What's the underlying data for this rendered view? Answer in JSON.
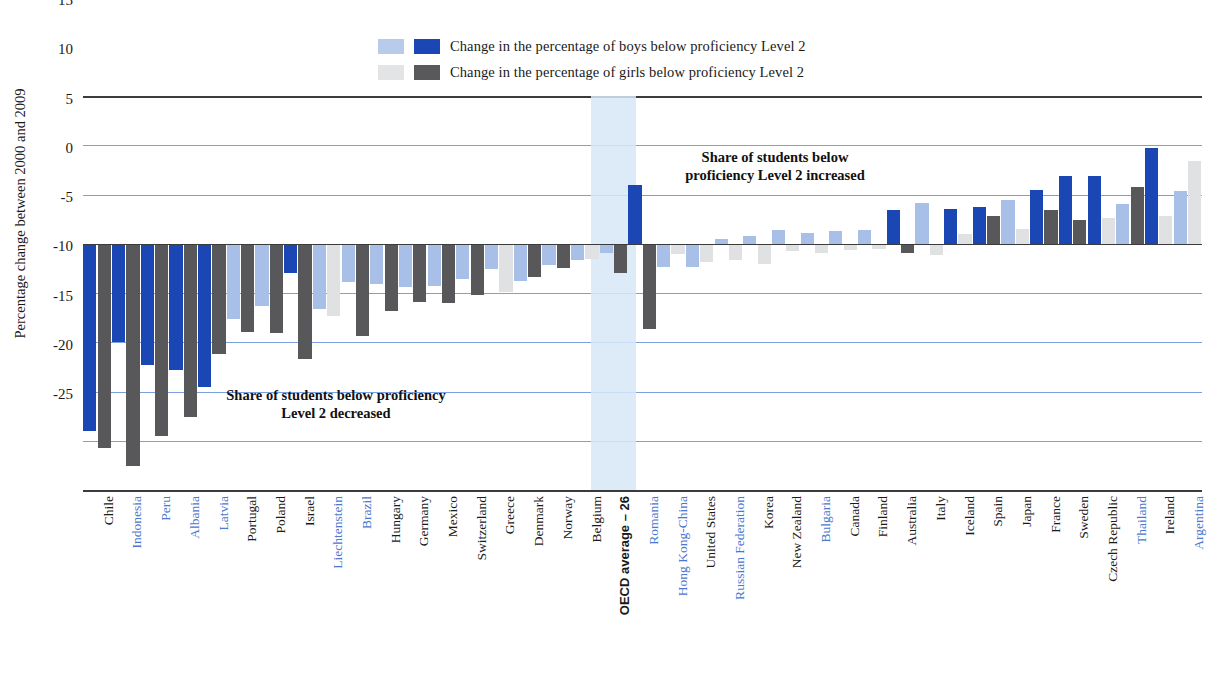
{
  "legend": {
    "items": [
      {
        "label": "Change in the percentage of boys below proficiency Level 2",
        "pale": "#b9cbeb",
        "dark": "#1b47b5"
      },
      {
        "label": "Change in the percentage of girls below proficiency Level 2",
        "pale": "#e2e4e6",
        "dark": "#59595b"
      }
    ]
  },
  "annotations": {
    "decreased": "Share of students below proficiency\nLevel 2 decreased",
    "decreased_line1": "Share of students below proficiency",
    "decreased_line2": "Level 2 decreased",
    "increased_line1": "Share of students below",
    "increased_line2": "proficiency Level 2 increased"
  },
  "chart_data": {
    "type": "bar",
    "title": "",
    "ylabel": "Percentage change between 2000 and 2009",
    "xlabel": "",
    "ylim": [
      -25,
      15
    ],
    "yticks": [
      15,
      10,
      5,
      0,
      -5,
      -10,
      -15,
      -20,
      -25
    ],
    "grid": true,
    "legend_position": "top-center",
    "categories": [
      "Chile",
      "Indonesia",
      "Peru",
      "Albania",
      "Latvia",
      "Portugal",
      "Poland",
      "Israel",
      "Liechtenstein",
      "Brazil",
      "Hungary",
      "Germany",
      "Mexico",
      "Switzerland",
      "Greece",
      "Denmark",
      "Norway",
      "Belgium",
      "OECD average – 26",
      "Romania",
      "Hong Kong-China",
      "United States",
      "Russian Federation",
      "Korea",
      "New Zealand",
      "Bulgaria",
      "Canada",
      "Finland",
      "Australia",
      "Italy",
      "Iceland",
      "Spain",
      "Japan",
      "France",
      "Sweden",
      "Czech Republic",
      "Thailand",
      "Ireland",
      "Argentina"
    ],
    "partner_countries": [
      "Indonesia",
      "Peru",
      "Albania",
      "Latvia",
      "Liechtenstein",
      "Brazil",
      "Romania",
      "Hong Kong-China",
      "Russian Federation",
      "Bulgaria",
      "Thailand",
      "Argentina"
    ],
    "highlighted_category": "OECD average – 26",
    "series": [
      {
        "name": "Change in the percentage of boys below proficiency Level 2",
        "values": [
          -19.0,
          -10.0,
          -12.3,
          -12.8,
          -14.5,
          -7.6,
          -6.3,
          -3.0,
          -6.6,
          -3.9,
          -4.1,
          -4.4,
          -4.3,
          -3.6,
          -2.6,
          -3.8,
          -2.2,
          -1.6,
          -0.9,
          6.0,
          -2.4,
          -2.4,
          0.5,
          0.8,
          1.4,
          1.1,
          1.3,
          1.4,
          3.4,
          4.1,
          3.5,
          3.7,
          4.4,
          5.5,
          6.9,
          6.9,
          4.0,
          9.7,
          5.4
        ],
        "significant": [
          true,
          true,
          true,
          true,
          true,
          false,
          false,
          true,
          false,
          false,
          false,
          false,
          false,
          false,
          false,
          false,
          false,
          false,
          false,
          true,
          false,
          false,
          false,
          false,
          false,
          false,
          false,
          false,
          true,
          false,
          true,
          true,
          false,
          true,
          true,
          true,
          false,
          true,
          false
        ]
      },
      {
        "name": "Change in the percentage of girls below proficiency Level 2",
        "values": [
          -20.7,
          -22.6,
          -19.5,
          -17.6,
          -11.2,
          -9.0,
          -9.1,
          -11.7,
          -7.3,
          -9.4,
          -6.8,
          -5.9,
          -6.0,
          -5.2,
          -4.9,
          -3.4,
          -2.5,
          -1.5,
          -3.0,
          -8.7,
          -1.0,
          -1.9,
          -1.6,
          -2.1,
          -0.7,
          -0.9,
          -0.6,
          -0.5,
          -0.9,
          -1.1,
          1.0,
          2.8,
          1.5,
          3.4,
          2.4,
          2.6,
          5.8,
          2.8,
          8.4
        ],
        "significant": [
          true,
          true,
          true,
          true,
          true,
          true,
          true,
          true,
          false,
          true,
          true,
          true,
          true,
          true,
          false,
          true,
          true,
          false,
          true,
          true,
          false,
          false,
          false,
          false,
          false,
          false,
          false,
          false,
          true,
          false,
          false,
          true,
          false,
          true,
          true,
          false,
          true,
          false,
          false
        ]
      }
    ]
  }
}
